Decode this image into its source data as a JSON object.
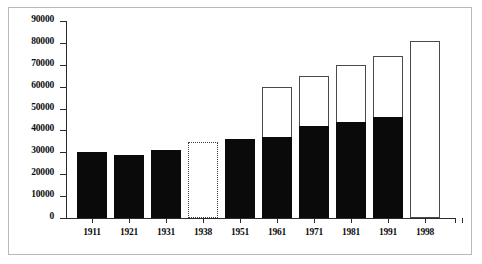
{
  "chart_data": {
    "type": "bar",
    "title": "",
    "subtitle": "",
    "xlabel": "",
    "ylabel": "",
    "categories": [
      "1911",
      "1921",
      "1931",
      "1938",
      "1951",
      "1961",
      "1971",
      "1981",
      "1991",
      "1998"
    ],
    "ylim": [
      0,
      90000
    ],
    "ytick_labels": [
      "0",
      "10000",
      "20000",
      "30000",
      "40000",
      "50000",
      "60000",
      "70000",
      "80000",
      "90000"
    ],
    "ytick_values": [
      0,
      10000,
      20000,
      30000,
      40000,
      50000,
      60000,
      70000,
      80000,
      90000
    ],
    "grid": false,
    "legend": "none",
    "series": [
      {
        "name": "Filled (solid black portion)",
        "values": [
          30000,
          29000,
          31000,
          null,
          36000,
          37000,
          42000,
          44000,
          46000,
          null
        ]
      },
      {
        "name": "Total (bar height)",
        "values": [
          30000,
          29000,
          31000,
          34500,
          36000,
          60000,
          65000,
          70000,
          74000,
          81000
        ]
      }
    ],
    "bars": [
      {
        "category": "1911",
        "total": 30000,
        "filled": 30000,
        "style": "solid"
      },
      {
        "category": "1921",
        "total": 29000,
        "filled": 29000,
        "style": "solid"
      },
      {
        "category": "1931",
        "total": 31000,
        "filled": 31000,
        "style": "solid"
      },
      {
        "category": "1938",
        "total": 34500,
        "filled": 0,
        "style": "dotted"
      },
      {
        "category": "1951",
        "total": 36000,
        "filled": 36000,
        "style": "solid"
      },
      {
        "category": "1961",
        "total": 60000,
        "filled": 37000,
        "style": "stacked"
      },
      {
        "category": "1971",
        "total": 65000,
        "filled": 42000,
        "style": "stacked"
      },
      {
        "category": "1981",
        "total": 70000,
        "filled": 44000,
        "style": "stacked"
      },
      {
        "category": "1991",
        "total": 74000,
        "filled": 46000,
        "style": "stacked"
      },
      {
        "category": "1998",
        "total": 81000,
        "filled": 0,
        "style": "outline"
      }
    ],
    "colors": {
      "filled": "#0a0a0a",
      "outline": "#4a4a4a",
      "background": "#ffffff",
      "axis": "#2b2b2b",
      "frame": "#b9b9b9"
    }
  }
}
